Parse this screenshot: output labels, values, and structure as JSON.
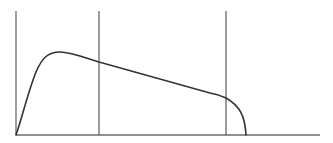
{
  "diagram": {
    "type": "line-curve-sketch",
    "colors": {
      "background": "#ffffff",
      "axis": "#6b6b6b",
      "divider": "#5a5a5a",
      "curve": "#333333"
    },
    "axes": {
      "y_axis": {
        "x": 16,
        "y_top": 11,
        "y_bottom": 135
      },
      "x_axis": {
        "y": 135,
        "x_left": 16,
        "x_right": 320
      }
    },
    "dividers": [
      {
        "x": 99,
        "y_top": 11,
        "y_bottom": 135
      },
      {
        "x": 226,
        "y_top": 11,
        "y_bottom": 135
      }
    ],
    "curve": {
      "path": "M16,135 C22,118 28,92 36,72 C42,58 48,52 60,52 C66,52 72,54 80,56 L99,62 L210,93 C216,94 222,96 226,98 C240,106 245,116 246,135"
    }
  }
}
